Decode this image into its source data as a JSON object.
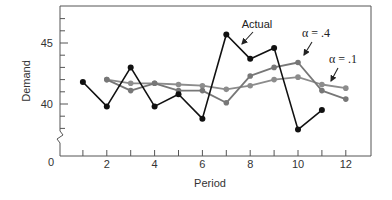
{
  "chart_data": {
    "type": "line",
    "title": "",
    "xlabel": "Period",
    "ylabel": "Demand",
    "xlim": [
      0,
      13
    ],
    "ylim": [
      37,
      47.5
    ],
    "y_axis_break": true,
    "x_ticks": [
      2,
      4,
      6,
      8,
      10,
      12
    ],
    "x_tick_labels": [
      "2",
      "4",
      "6",
      "8",
      "10",
      "12"
    ],
    "x_origin_label": "0",
    "y_ticks": [
      40,
      45
    ],
    "y_tick_labels": [
      "40",
      "45"
    ],
    "grid": false,
    "legend": "inline annotations",
    "series": [
      {
        "name": "Actual",
        "color": "#111111",
        "x": [
          1,
          2,
          3,
          4,
          5,
          6,
          7,
          8,
          9,
          10,
          11
        ],
        "values": [
          41.8,
          39.8,
          43.0,
          39.8,
          40.8,
          38.8,
          45.7,
          43.7,
          44.6,
          37.9,
          39.5
        ]
      },
      {
        "name": "α = .4",
        "color": "#777777",
        "x": [
          2,
          3,
          4,
          5,
          6,
          7,
          8,
          9,
          10,
          11,
          12
        ],
        "values": [
          42.0,
          41.1,
          41.7,
          41.1,
          41.1,
          40.1,
          42.3,
          43.0,
          43.4,
          41.1,
          40.4
        ]
      },
      {
        "name": "α = .1",
        "color": "#8c8c8c",
        "x": [
          2,
          3,
          4,
          5,
          6,
          7,
          8,
          9,
          10,
          11,
          12
        ],
        "values": [
          42.0,
          41.7,
          41.7,
          41.6,
          41.5,
          41.2,
          41.5,
          42.0,
          42.2,
          41.6,
          41.3
        ]
      }
    ],
    "annotations": [
      {
        "text": "Actual",
        "series": "Actual",
        "x": 7.6,
        "y": 46.6
      },
      {
        "text": "α = .4",
        "series": "α = .4",
        "x": 10.3,
        "y": 45.3
      },
      {
        "text": "α = .1",
        "series": "α = .1",
        "x": 11.2,
        "y": 43.2
      }
    ]
  }
}
